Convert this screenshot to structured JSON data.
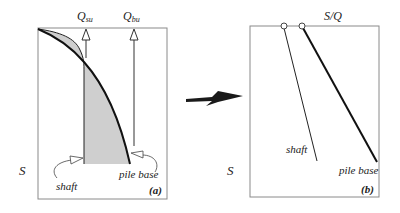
{
  "panel_a": {
    "top_labels": {
      "q_shaft_main": "Q",
      "q_shaft_sub": "su",
      "q_base_main": "Q",
      "q_base_sub": "bu"
    },
    "axis_label": "S",
    "curve_labels": {
      "shaft": "shaft",
      "pile_base": "pile base"
    },
    "panel_tag": "(a)"
  },
  "panel_b": {
    "top_label": "S/Q",
    "axis_label": "S",
    "line_labels": {
      "shaft": "shaft",
      "pile_base": "pile base"
    },
    "panel_tag": "(b)"
  },
  "colors": {
    "line": "#111111",
    "frame": "#888888",
    "fill": "#cfcfcf",
    "arrow": "#1a1a1a"
  }
}
